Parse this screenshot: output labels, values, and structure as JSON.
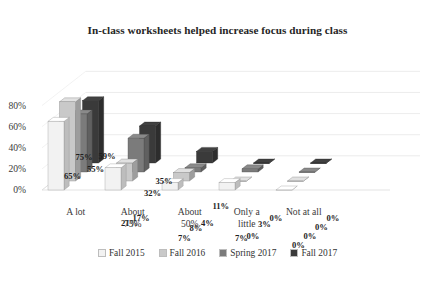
{
  "chart_data": {
    "type": "bar",
    "title": "In-class worksheets helped increase focus during class",
    "xlabel": "",
    "ylabel": "",
    "ylim": [
      0,
      80
    ],
    "yticks": [
      "0%",
      "20%",
      "40%",
      "60%",
      "80%"
    ],
    "grid": true,
    "legend_position": "bottom",
    "three_d": true,
    "categories": [
      "A lot",
      "About 75%",
      "About 50%",
      "Only a little",
      "Not at all"
    ],
    "category_lines": [
      [
        "A lot",
        ""
      ],
      [
        "About",
        "75%"
      ],
      [
        "About",
        "50%"
      ],
      [
        "Only a",
        "little"
      ],
      [
        "Not at all",
        ""
      ]
    ],
    "series": [
      {
        "name": "Fall 2015",
        "color": "#f2f2f2",
        "values": [
          65,
          21,
          7,
          7,
          0
        ],
        "labels": [
          "65%",
          "21%",
          "7%",
          "7%",
          "0%"
        ]
      },
      {
        "name": "Fall 2016",
        "color": "#c9c9c9",
        "values": [
          75,
          17,
          8,
          0,
          0
        ],
        "labels": [
          "75%",
          "17%",
          "8%",
          "0%",
          "0%"
        ]
      },
      {
        "name": "Spring 2017",
        "color": "#7b7b7b",
        "values": [
          55,
          55,
          32,
          4,
          3
        ],
        "labels": [
          "55%",
          "55%",
          "32%",
          "4%",
          "3%"
        ]
      },
      {
        "name": "Fall 2017",
        "color": "#3a3a3a",
        "values": [
          59,
          59,
          35,
          11,
          0
        ],
        "labels": [
          "59%",
          "59%",
          "35%",
          "11%",
          "0%"
        ]
      }
    ],
    "displayed_groups": [
      {
        "category": "A lot",
        "bars": [
          {
            "series": "Fall 2015",
            "value": 65,
            "label": "65%"
          },
          {
            "series": "Fall 2016",
            "value": 75,
            "label": "75%"
          },
          {
            "series": "Spring 2017",
            "value": 55,
            "label": "55%"
          },
          {
            "series": "Fall 2017",
            "value": 59,
            "label": "59%"
          }
        ]
      },
      {
        "category": "About 75%",
        "bars": [
          {
            "series": "Fall 2015",
            "value": 21,
            "label": "21%"
          },
          {
            "series": "Fall 2016",
            "value": 17,
            "label": "17%"
          },
          {
            "series": "Spring 2017",
            "value": 32,
            "label": "32%"
          },
          {
            "series": "Fall 2017",
            "value": 35,
            "label": "35%"
          }
        ]
      },
      {
        "category": "About 50%",
        "bars": [
          {
            "series": "Fall 2015",
            "value": 7,
            "label": "7%"
          },
          {
            "series": "Fall 2016",
            "value": 8,
            "label": "8%"
          },
          {
            "series": "Spring 2017",
            "value": 4,
            "label": "4%"
          },
          {
            "series": "Fall 2017",
            "value": 11,
            "label": "11%"
          }
        ]
      },
      {
        "category": "Only a little",
        "bars": [
          {
            "series": "Fall 2015",
            "value": 7,
            "label": "7%"
          },
          {
            "series": "Fall 2016",
            "value": 0,
            "label": "0%"
          },
          {
            "series": "Spring 2017",
            "value": 3,
            "label": "3%"
          },
          {
            "series": "Fall 2017",
            "value": 0,
            "label": "0%"
          }
        ]
      },
      {
        "category": "Not at all",
        "bars": [
          {
            "series": "Fall 2015",
            "value": 0,
            "label": "0%"
          },
          {
            "series": "Fall 2016",
            "value": 0,
            "label": "0%"
          },
          {
            "series": "Spring 2017",
            "value": 0,
            "label": "0%"
          },
          {
            "series": "Fall 2017",
            "value": 0,
            "label": "0%"
          }
        ]
      }
    ]
  },
  "legend": {
    "items": [
      {
        "label": "Fall 2015",
        "color": "#f2f2f2"
      },
      {
        "label": "Fall 2016",
        "color": "#c9c9c9"
      },
      {
        "label": "Spring 2017",
        "color": "#7b7b7b"
      },
      {
        "label": "Fall 2017",
        "color": "#3a3a3a"
      }
    ]
  },
  "axis": {
    "y_ticks": [
      "80%",
      "60%",
      "40%",
      "20%",
      "0%"
    ],
    "x_labels": [
      {
        "line1": "A lot",
        "line2": ""
      },
      {
        "line1": "About",
        "line2": "75%"
      },
      {
        "line1": "About",
        "line2": "50%"
      },
      {
        "line1": "Only a",
        "line2": "little"
      },
      {
        "line1": "Not at all",
        "line2": ""
      }
    ]
  }
}
